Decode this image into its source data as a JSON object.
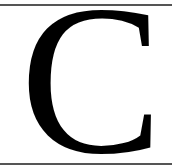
{
  "card": {
    "letter": "C",
    "text_color": "#000000",
    "background_color": "#ffffff",
    "rule_color": "#555555"
  }
}
